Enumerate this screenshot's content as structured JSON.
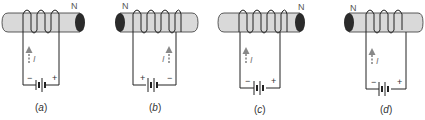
{
  "figure": {
    "panels": [
      {
        "id": "a",
        "caption_open": "(",
        "caption_letter": "a",
        "caption_close": ")",
        "north_label": "N",
        "north_side": "right",
        "current_label": "I",
        "left_terminal": "−",
        "right_terminal": "+",
        "dark_end": "right"
      },
      {
        "id": "b",
        "caption_open": "(",
        "caption_letter": "b",
        "caption_close": ")",
        "north_label": "N",
        "north_side": "left",
        "current_label": "I",
        "left_terminal": "+",
        "right_terminal": "−",
        "dark_end": "left"
      },
      {
        "id": "c",
        "caption_open": "(",
        "caption_letter": "c",
        "caption_close": ")",
        "north_label": "N",
        "north_side": "right",
        "current_label": "I",
        "left_terminal": "−",
        "right_terminal": "+",
        "dark_end": "right"
      },
      {
        "id": "d",
        "caption_open": "(",
        "caption_letter": "d",
        "caption_close": ")",
        "north_label": "N",
        "north_side": "left",
        "current_label": "I",
        "left_terminal": "−",
        "right_terminal": "+",
        "dark_end": "left"
      }
    ],
    "colors": {
      "rod_fill": "#d9d9d9",
      "rod_stroke": "#333333",
      "rod_end_dark": "#2b2b2b",
      "wire": "#222222",
      "arrow": "#888888"
    }
  }
}
